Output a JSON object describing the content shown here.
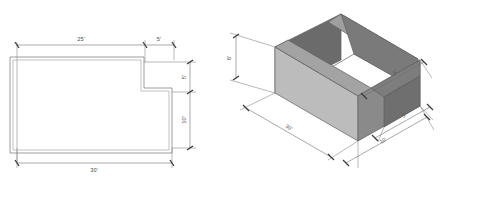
{
  "drawing": {
    "title": "Foundation wall layout — plan and isometric views",
    "background_color": "#ffffff",
    "line_color": "#8d8d8d",
    "dim_text_color": "#4a4a4a",
    "units_note": "feet"
  },
  "plan_view": {
    "name": "plan-view",
    "description": "Top-down plan of an L-shaped (notched) foundation wall",
    "dimensions": [
      {
        "id": "top-left-run",
        "label": "25'",
        "value": 25,
        "unit": "ft",
        "orientation": "horizontal",
        "position": "top-left"
      },
      {
        "id": "top-right-run",
        "label": "5'",
        "value": 5,
        "unit": "ft",
        "orientation": "horizontal",
        "position": "top-right"
      },
      {
        "id": "right-upper",
        "label": "5'",
        "value": 5,
        "unit": "ft",
        "orientation": "vertical",
        "position": "right-upper"
      },
      {
        "id": "right-lower",
        "label": "10'",
        "value": 10,
        "unit": "ft",
        "orientation": "vertical",
        "position": "right-lower"
      },
      {
        "id": "bottom-run",
        "label": "30'",
        "value": 30,
        "unit": "ft",
        "orientation": "horizontal",
        "position": "bottom"
      }
    ]
  },
  "iso_view": {
    "name": "isometric-view",
    "description": "Isometric pictorial of the same foundation wall with a notched right end",
    "face_colors": {
      "inner_back_wall": "#6b6b6b",
      "outer_front_wall": "#b9b9b9",
      "top_surface": "#9a9a9a",
      "right_end_wall": "#858585",
      "notch_face": "#787878",
      "floor": "#ffffff"
    },
    "dimensions": [
      {
        "id": "height",
        "label": "6'",
        "value": 6,
        "unit": "ft",
        "position": "left-vertical"
      },
      {
        "id": "length",
        "label": "30'",
        "value": 30,
        "unit": "ft",
        "position": "bottom-left-edge"
      },
      {
        "id": "width",
        "label": "10'",
        "value": 10,
        "unit": "ft",
        "position": "bottom-right-edge"
      },
      {
        "id": "notch-depth",
        "label": "5'",
        "value": 5,
        "unit": "ft",
        "position": "right-upper"
      },
      {
        "id": "notch-width",
        "label": "5'",
        "value": 5,
        "unit": "ft",
        "position": "right-lower"
      }
    ]
  }
}
